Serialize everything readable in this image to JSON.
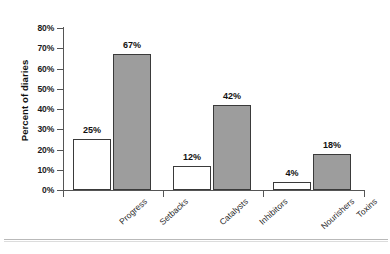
{
  "chart_data": {
    "type": "bar",
    "title": "",
    "xlabel": "",
    "ylabel": "Percent of diaries",
    "ylim": [
      0,
      80
    ],
    "ytick_labels": [
      "0%",
      "10%",
      "20%",
      "30%",
      "40%",
      "50%",
      "60%",
      "70%",
      "80%"
    ],
    "ytick_values": [
      0,
      10,
      20,
      30,
      40,
      50,
      60,
      70,
      80
    ],
    "grid": false,
    "legend": "none",
    "categories": [
      "Progress",
      "Setbacks",
      "Catalysts",
      "Inhibitors",
      "Nourishers",
      "Toxins"
    ],
    "values": [
      25,
      67,
      12,
      42,
      4,
      18
    ],
    "value_labels": [
      "25%",
      "67%",
      "12%",
      "42%",
      "4%",
      "18%"
    ],
    "bar_styles": [
      "open",
      "filled",
      "open",
      "filled",
      "open",
      "filled"
    ],
    "groups": [
      {
        "name": "group-1",
        "categories": [
          "Progress",
          "Setbacks"
        ]
      },
      {
        "name": "group-2",
        "categories": [
          "Catalysts",
          "Inhibitors"
        ]
      },
      {
        "name": "group-3",
        "categories": [
          "Nourishers",
          "Toxins"
        ]
      }
    ],
    "colors": {
      "open_bar_fill": "#ffffff",
      "filled_bar_fill": "#9d9d9d",
      "bar_outline": "#3a3a3a",
      "axis": "#555555",
      "text": "#111111"
    }
  }
}
